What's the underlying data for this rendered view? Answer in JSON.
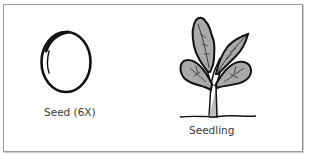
{
  "figure": {
    "panels": [
      {
        "id": "seed",
        "label": "Seed (6X)",
        "icon": "seed-icon"
      },
      {
        "id": "seedling",
        "label": "Seedling",
        "icon": "seedling-icon"
      }
    ]
  },
  "colors": {
    "outline": "#111111",
    "leaf_fill": "#a9a9a9",
    "border": "#9a9a9a",
    "label_text": "#3a3a3a"
  }
}
